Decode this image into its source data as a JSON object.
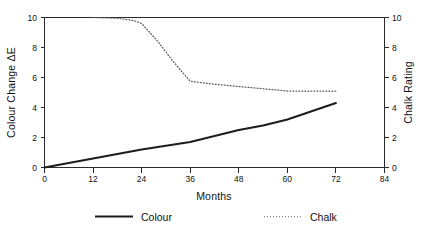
{
  "chart_data": {
    "type": "line",
    "title": "",
    "xlabel": "Months",
    "ylabel": "Colour Change ΔE",
    "y2label": "Chalk Rating",
    "xlim": [
      0,
      84
    ],
    "ylim": [
      0,
      10
    ],
    "y2lim": [
      0,
      10
    ],
    "grid": false,
    "legend_position": "bottom",
    "xticks": [
      0,
      12,
      24,
      36,
      48,
      60,
      72,
      84
    ],
    "xticklabels": [
      "0",
      "12",
      "24",
      "36",
      "48",
      "60",
      "72",
      "84"
    ],
    "yticks": [
      0,
      2,
      4,
      6,
      8,
      10
    ],
    "yticklabels": [
      "0",
      "2",
      "4",
      "6",
      "8",
      "10"
    ],
    "y2ticks": [
      0,
      2,
      4,
      6,
      8,
      10
    ],
    "y2ticklabels": [
      "0",
      "2",
      "4",
      "6",
      "8",
      "10"
    ],
    "series": [
      {
        "name": "Colour",
        "axis": "left",
        "style": "solid",
        "color": "#1c1c1c",
        "x": [
          0,
          6,
          12,
          18,
          24,
          30,
          36,
          42,
          48,
          54,
          60,
          66,
          72
        ],
        "values": [
          0.0,
          0.3,
          0.6,
          0.9,
          1.2,
          1.45,
          1.7,
          2.1,
          2.5,
          2.8,
          3.2,
          3.75,
          4.3
        ]
      },
      {
        "name": "Chalk",
        "axis": "right",
        "style": "dotted",
        "color": "#5a5a5a",
        "x": [
          12,
          18,
          22,
          24,
          28,
          32,
          36,
          42,
          48,
          54,
          60,
          66,
          72
        ],
        "values": [
          10.0,
          9.95,
          9.8,
          9.6,
          8.4,
          7.0,
          5.75,
          5.55,
          5.4,
          5.25,
          5.1,
          5.1,
          5.1
        ]
      }
    ]
  },
  "axes": {
    "x_title": "Months",
    "y_left_title": "Colour Change ΔE",
    "y_right_title": "Chalk Rating"
  },
  "legend": {
    "items": [
      {
        "label": "Colour",
        "style": "solid"
      },
      {
        "label": "Chalk",
        "style": "dotted"
      }
    ]
  }
}
